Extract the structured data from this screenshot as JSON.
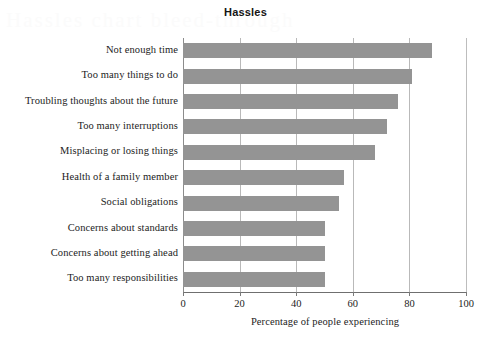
{
  "chart_data": {
    "type": "bar",
    "orientation": "horizontal",
    "title": "Hassles",
    "xlabel": "Percentage of people experiencing",
    "ylabel": "",
    "xlim": [
      0,
      100
    ],
    "ylim": null,
    "grid": true,
    "legend": null,
    "bar_color": "#949494",
    "xticks": [
      "0",
      "20",
      "40",
      "60",
      "80",
      "100"
    ],
    "xtick_values": [
      0,
      20,
      40,
      60,
      80,
      100
    ],
    "categories": [
      "Not enough time",
      "Too many things to do",
      "Troubling thoughts about the future",
      "Too many interruptions",
      "Misplacing or losing things",
      "Health of a family member",
      "Social obligations",
      "Concerns about standards",
      "Concerns about getting ahead",
      "Too many responsibilities"
    ],
    "values": [
      88,
      81,
      76,
      72,
      68,
      57,
      55,
      50,
      50,
      50
    ]
  },
  "watermark": {
    "text": "Hassles chart bleed-through"
  }
}
